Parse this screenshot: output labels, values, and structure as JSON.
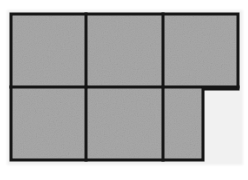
{
  "figure": {
    "title": "Shaded polyomino grid figure",
    "shape_name": "hexomino",
    "cell_count": 6,
    "rows": 2,
    "columns": 3,
    "fill_color": "#a8a8a8",
    "line_color": "#141414",
    "background_color": "#ffffff",
    "halo_color": "#f1f1f1",
    "line_width": 3,
    "outline_points": "11,14 238,14 238,89 203,89 203,160 11,160",
    "dividers": {
      "horizontal": [
        {
          "name": "row-divider",
          "x1": 11,
          "y1": 87,
          "x2": 238,
          "y2": 87
        }
      ],
      "vertical": [
        {
          "name": "column-divider-left",
          "x1": 86,
          "y1": 14,
          "x2": 86,
          "y2": 160
        },
        {
          "name": "column-divider-right",
          "x1": 163,
          "y1": 14,
          "x2": 163,
          "y2": 160
        }
      ]
    },
    "cells": [
      {
        "name": "cell-top-left",
        "row": 1,
        "col": 1,
        "x": 11,
        "y": 14,
        "width": 75,
        "height": 73
      },
      {
        "name": "cell-top-middle",
        "row": 1,
        "col": 2,
        "x": 86,
        "y": 14,
        "width": 77,
        "height": 73
      },
      {
        "name": "cell-top-right",
        "row": 1,
        "col": 3,
        "x": 163,
        "y": 14,
        "width": 75,
        "height": 73
      },
      {
        "name": "cell-bottom-left",
        "row": 2,
        "col": 1,
        "x": 11,
        "y": 87,
        "width": 75,
        "height": 73
      },
      {
        "name": "cell-bottom-middle",
        "row": 2,
        "col": 2,
        "x": 86,
        "y": 87,
        "width": 77,
        "height": 73
      },
      {
        "name": "cell-bottom-right",
        "row": 2,
        "col": 3,
        "x": 163,
        "y": 87,
        "width": 40,
        "height": 73
      }
    ]
  }
}
